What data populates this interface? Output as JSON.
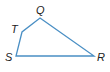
{
  "figure": {
    "type": "quadrilateral",
    "stroke_color": "#4a8fc4",
    "vertices": [
      {
        "label": "Q",
        "x": 40,
        "y": 18,
        "lx": 36,
        "ly": 14
      },
      {
        "label": "R",
        "x": 94,
        "y": 56,
        "lx": 97,
        "ly": 61
      },
      {
        "label": "S",
        "x": 16,
        "y": 56,
        "lx": 5,
        "ly": 61
      },
      {
        "label": "T",
        "x": 22,
        "y": 32,
        "lx": 11,
        "ly": 33
      }
    ],
    "order": [
      "Q",
      "R",
      "S",
      "T"
    ]
  }
}
